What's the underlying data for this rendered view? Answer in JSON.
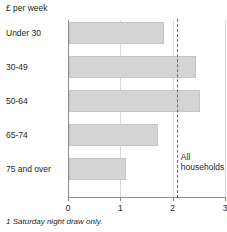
{
  "chart_data": {
    "type": "bar",
    "orientation": "horizontal",
    "title": "",
    "ylabel": "£ per week",
    "xlabel": "",
    "categories": [
      "Under 30",
      "30-49",
      "50-64",
      "65-74",
      "75 and over"
    ],
    "values": [
      1.82,
      2.43,
      2.5,
      1.7,
      1.09
    ],
    "xlim": [
      0,
      3
    ],
    "xticks": [
      0,
      1,
      2,
      3
    ],
    "xtick_labels": [
      "0",
      "1",
      "2",
      "3"
    ],
    "grid": true,
    "legend": "none",
    "annotations": [
      {
        "name": "all-households",
        "label_line1": "All",
        "label_line2": "households",
        "value": 2.08,
        "style": "dashed-vertical-line"
      }
    ],
    "footnote": "1 Saturday night draw only.",
    "colors": {
      "bar_fill": "#d4d4d4",
      "bar_border": "#c6c6c6",
      "axis": "#8a8a8a",
      "gridline": "#d9d9d9",
      "reference_line": "#6b6b6b",
      "text": "#231f20"
    }
  }
}
